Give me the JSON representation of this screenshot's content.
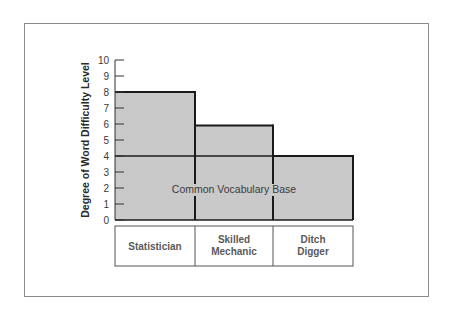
{
  "chart_data": {
    "type": "bar",
    "title": "",
    "xlabel": "",
    "ylabel": "Degree of Word Difficulty Level",
    "ylim": [
      0,
      10
    ],
    "yticks": [
      0,
      1,
      2,
      3,
      4,
      5,
      6,
      7,
      8,
      9,
      10
    ],
    "categories": [
      "Statistician",
      "Skilled Mechanic",
      "Ditch Digger"
    ],
    "category_lines": [
      [
        "Statistician"
      ],
      [
        "Skilled",
        "Mechanic"
      ],
      [
        "Ditch",
        "Digger"
      ]
    ],
    "values": [
      8,
      5.9,
      4
    ],
    "reference_line": {
      "value": 4,
      "label": "Common Vocabulary Base"
    },
    "grid": false,
    "legend": "none",
    "colors": {
      "bar_fill": "#c9c9c9",
      "bar_stroke": "#1a1a1a",
      "frame": "#8a8a8a"
    }
  }
}
